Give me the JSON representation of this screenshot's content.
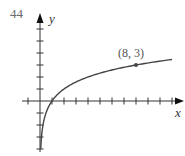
{
  "problem": {
    "number": "44"
  },
  "chart_data": {
    "type": "line",
    "title": "",
    "function": "y = log_2(x)",
    "xlabel": "x",
    "ylabel": "y",
    "xlim": [
      -1,
      11.5
    ],
    "ylim": [
      -4,
      7
    ],
    "grid": false,
    "x_ticks": [
      -1,
      1,
      2,
      3,
      4,
      5,
      6,
      7,
      8,
      9,
      10,
      11
    ],
    "y_ticks": [
      -4,
      -3,
      -2,
      -1,
      1,
      2,
      3,
      4,
      5,
      6
    ],
    "series": [
      {
        "name": "curve",
        "x": [
          0.0625,
          0.125,
          0.25,
          0.5,
          1,
          2,
          4,
          8,
          11
        ],
        "y": [
          -4,
          -3,
          -2,
          -1,
          0,
          1,
          2,
          3,
          3.46
        ]
      }
    ],
    "annotations": [
      {
        "text": "(8, 3)",
        "x": 8,
        "y": 3,
        "marked_point": true
      }
    ]
  }
}
